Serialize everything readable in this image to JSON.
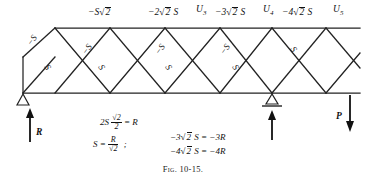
{
  "figure": {
    "caption": "Fig. 10-15.",
    "type": "truss-force-diagram"
  },
  "top_chord_labels": [
    {
      "id": "u1u2",
      "text": "−S√2",
      "x": 100,
      "y": 8
    },
    {
      "id": "u2u3",
      "text": "−2√2 S",
      "x": 155,
      "y": 8
    },
    {
      "id": "u3",
      "text": "U",
      "sub": "3",
      "x": 196,
      "y": 6
    },
    {
      "id": "u3u4",
      "text": "−3√2 S",
      "x": 220,
      "y": 8
    },
    {
      "id": "u4",
      "text": "U",
      "sub": "4",
      "x": 263,
      "y": 6
    },
    {
      "id": "u4u5",
      "text": "−4√2 S",
      "x": 285,
      "y": 8
    },
    {
      "id": "u5",
      "text": "U",
      "sub": "5",
      "x": 333,
      "y": 6
    }
  ],
  "diagonal_labels": [
    {
      "id": "d1",
      "text": "−S",
      "x": 30,
      "y": 40,
      "rot": -45
    },
    {
      "id": "d2",
      "text": "S",
      "x": 44,
      "y": 68,
      "rot": 45
    },
    {
      "id": "d3",
      "text": "−S",
      "x": 85,
      "y": 48,
      "rot": -45
    },
    {
      "id": "d4",
      "text": "S",
      "x": 99,
      "y": 68,
      "rot": 45
    },
    {
      "id": "d5",
      "text": "−S",
      "x": 158,
      "y": 48,
      "rot": -45
    },
    {
      "id": "d6",
      "text": "S",
      "x": 166,
      "y": 68,
      "rot": 45
    },
    {
      "id": "d7",
      "text": "−S",
      "x": 223,
      "y": 48,
      "rot": -45
    },
    {
      "id": "d8",
      "text": "S",
      "x": 233,
      "y": 68,
      "rot": 45
    },
    {
      "id": "d9",
      "text": "S",
      "x": 292,
      "y": 48,
      "rot": 45
    }
  ],
  "forces": {
    "left_reaction": {
      "label": "R",
      "x": 28,
      "y": 133
    },
    "right_load": {
      "label": "P",
      "x": 337,
      "y": 122
    }
  },
  "supports": [
    {
      "id": "left-pin-support",
      "x": 23,
      "y": 95
    },
    {
      "id": "mid-roller-support",
      "x": 272,
      "y": 95
    }
  ],
  "equations": {
    "line1": {
      "lead": "2S",
      "num": "√2",
      "den": "2",
      "tail": "= R"
    },
    "line2": {
      "lead": "S =",
      "num": "R",
      "den": "√2",
      "sep": ";"
    },
    "line3": "−3√2 S = −3R",
    "line4": "−4√2 S = −4R"
  },
  "geometry": {
    "top_chord_y": 28,
    "bottom_chord_y": 93,
    "left_post_x": 23,
    "panel_nodes_bottom": [
      55,
      110,
      165,
      220,
      272,
      350
    ],
    "panel_nodes_top": [
      55,
      110,
      165,
      220,
      272,
      350
    ],
    "stroke_color": "#222222"
  }
}
